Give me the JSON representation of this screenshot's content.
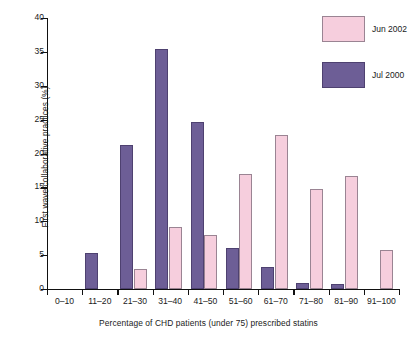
{
  "chart_data": {
    "type": "bar",
    "title": "",
    "xlabel": "Percentage of CHD patients (under 75) prescribed statins",
    "ylabel": "First wave collaborative practices (%)",
    "categories": [
      "0–10",
      "11–20",
      "21–30",
      "31–40",
      "41–50",
      "51–60",
      "61–70",
      "71–80",
      "81–90",
      "91–100"
    ],
    "series": [
      {
        "name": "Jun 2002",
        "color": "#f6cedd",
        "values": [
          0,
          0,
          3.0,
          9.1,
          8.0,
          17.0,
          22.8,
          14.8,
          16.7,
          5.8
        ]
      },
      {
        "name": "Jul 2000",
        "color": "#6d5e96",
        "values": [
          0,
          5.3,
          21.3,
          35.4,
          24.6,
          6.0,
          3.2,
          0.9,
          0.7,
          0
        ]
      }
    ],
    "ylim": [
      0,
      40
    ],
    "yticks": [
      0,
      5,
      10,
      15,
      20,
      25,
      30,
      35,
      40
    ],
    "ytick_labels": [
      "0",
      "5",
      "10",
      "15",
      "20",
      "25",
      "30",
      "35",
      "40"
    ],
    "grid": false,
    "legend_position": "top-right"
  },
  "legend": {
    "entries": [
      {
        "label": "Jun 2002",
        "color": "#f6cedd"
      },
      {
        "label": "Jul 2000",
        "color": "#6d5e96"
      }
    ]
  }
}
